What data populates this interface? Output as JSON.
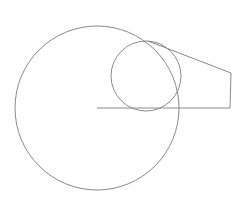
{
  "diagram": {
    "title": "",
    "stroke_color": "#8a8a8a",
    "background_color": "#ffffff",
    "shapes": [
      {
        "name": "large-circle",
        "type": "circle"
      },
      {
        "name": "small-circle",
        "type": "circle"
      },
      {
        "name": "radius-line",
        "type": "line"
      },
      {
        "name": "tangent-polyline",
        "type": "polyline"
      }
    ]
  }
}
